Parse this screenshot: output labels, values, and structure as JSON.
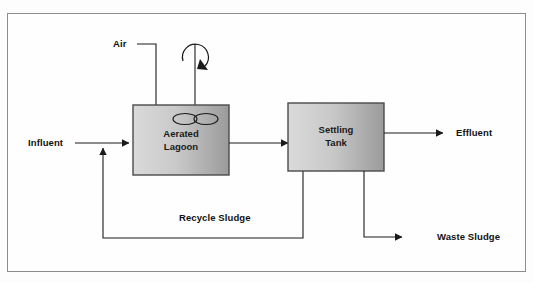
{
  "figure": {
    "type": "process-flow-diagram"
  },
  "units": [
    {
      "id": "aerated-lagoon",
      "label_line1": "Aerated",
      "label_line2": "Lagoon",
      "fill_left": "#d6d6d6",
      "fill_right": "#9e9e9e",
      "border": "#4a4a4a"
    },
    {
      "id": "settling-tank",
      "label_line1": "Settling",
      "label_line2": "Tank",
      "fill_left": "#d6d6d6",
      "fill_right": "#9e9e9e",
      "border": "#4a4a4a"
    }
  ],
  "streams": [
    {
      "id": "influent",
      "label": "Influent"
    },
    {
      "id": "air",
      "label": "Air"
    },
    {
      "id": "effluent",
      "label": "Effluent"
    },
    {
      "id": "recycle-sludge",
      "label": "Recycle Sludge"
    },
    {
      "id": "waste-sludge",
      "label": "Waste Sludge"
    }
  ],
  "symbols": {
    "rotation_arrow": "clockwise-rotation-arrow",
    "impeller": "impeller-blades",
    "shaft": "impeller-shaft"
  },
  "colors": {
    "line": "#1a1a1a",
    "frame": "#8c8c8c",
    "text": "#111111"
  }
}
